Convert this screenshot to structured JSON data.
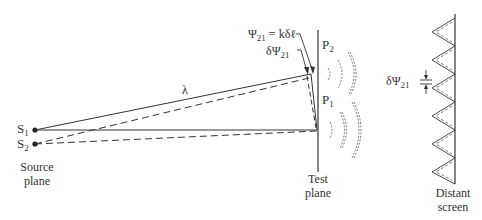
{
  "diagram": {
    "labels": {
      "s1": "S",
      "s1_sub": "1",
      "s2": "S",
      "s2_sub": "2",
      "source_plane_line1": "Source",
      "source_plane_line2": "plane",
      "lambda": "λ",
      "psi_eq": "Ψ",
      "psi_eq_sub": "21",
      "psi_eq_rhs": " = kδℓ",
      "dpsi": "δΨ",
      "dpsi_sub": "21",
      "p1": "P",
      "p1_sub": "1",
      "p2": "P",
      "p2_sub": "2",
      "test_plane_line1": "Test",
      "test_plane_line2": "plane",
      "screen_dpsi": "δΨ",
      "screen_dpsi_sub": "21",
      "screen_line1": "Distant",
      "screen_line2": "screen"
    },
    "colors": {
      "line": "#333333",
      "wave": "#555555"
    }
  }
}
